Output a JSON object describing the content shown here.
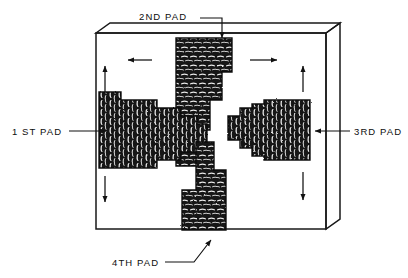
{
  "figure": {
    "title": "",
    "background_color": "#ffffff",
    "ink_color": "#111111",
    "plate": {
      "name": "rectangular-plate",
      "face": {
        "x": 96,
        "y": 33,
        "width": 230,
        "height": 196
      },
      "depth_offset": {
        "dx": 14,
        "dy": -10
      },
      "stroke_width": 1.6
    },
    "labels": [
      {
        "id": "pad1",
        "text": "1 ST  PAD",
        "x": 12,
        "y": 134,
        "anchor": "start"
      },
      {
        "id": "pad2",
        "text": "2ND PAD",
        "x": 140,
        "y": 16,
        "anchor": "start"
      },
      {
        "id": "pad3",
        "text": "3RD PAD",
        "x": 352,
        "y": 134,
        "anchor": "start"
      },
      {
        "id": "pad4",
        "text": "4TH PAD",
        "x": 112,
        "y": 268,
        "anchor": "start"
      }
    ],
    "leaders": [
      {
        "id": "leader-pad1",
        "from": [
          69,
          131
        ],
        "to": [
          108,
          131
        ],
        "arrow": "end"
      },
      {
        "id": "leader-pad2",
        "from": [
          200,
          18
        ],
        "bend": [
          222,
          18
        ],
        "to": [
          222,
          40
        ],
        "arrow": "end"
      },
      {
        "id": "leader-pad3",
        "from": [
          348,
          131
        ],
        "to": [
          313,
          131
        ],
        "arrow": "end"
      },
      {
        "id": "leader-pad4",
        "from": [
          166,
          263
        ],
        "bend": [
          196,
          263
        ],
        "to": [
          212,
          239
        ],
        "arrow": "end"
      }
    ],
    "direction_arrows": [
      {
        "id": "arrow-top-left",
        "direction": "left",
        "x1": 152,
        "y1": 60,
        "x2": 128,
        "y2": 60
      },
      {
        "id": "arrow-top-right",
        "direction": "right",
        "x1": 250,
        "y1": 60,
        "x2": 277,
        "y2": 60
      },
      {
        "id": "arrow-left-up",
        "direction": "up",
        "x1": 105,
        "y1": 92,
        "x2": 105,
        "y2": 66
      },
      {
        "id": "arrow-left-down",
        "direction": "down",
        "x1": 105,
        "y1": 176,
        "x2": 105,
        "y2": 202
      },
      {
        "id": "arrow-right-up",
        "direction": "up",
        "x1": 303,
        "y1": 92,
        "x2": 303,
        "y2": 66
      },
      {
        "id": "arrow-right-down",
        "direction": "down",
        "x1": 303,
        "y1": 172,
        "x2": 303,
        "y2": 200
      }
    ],
    "pads": [
      {
        "id": "pad-2",
        "label": "2ND PAD",
        "orientation": "vertical",
        "bead_axis": "horizontal-beads-stacked-vertically",
        "steps": [
          {
            "x": 176,
            "y": 38,
            "w": 56,
            "h": 34
          },
          {
            "x": 176,
            "y": 38,
            "w": 46,
            "h": 62
          },
          {
            "x": 176,
            "y": 38,
            "w": 34,
            "h": 92
          },
          {
            "x": 176,
            "y": 38,
            "w": 24,
            "h": 128
          }
        ]
      },
      {
        "id": "pad-1",
        "label": "1 ST PAD",
        "orientation": "horizontal",
        "bead_axis": "vertical-beads-in-rows",
        "steps": [
          {
            "x": 99,
            "y": 92,
            "w": 22,
            "h": 76
          },
          {
            "x": 99,
            "y": 100,
            "w": 58,
            "h": 68
          },
          {
            "x": 99,
            "y": 108,
            "w": 82,
            "h": 52
          },
          {
            "x": 99,
            "y": 116,
            "w": 98,
            "h": 36
          },
          {
            "x": 99,
            "y": 124,
            "w": 108,
            "h": 22
          }
        ]
      },
      {
        "id": "pad-3",
        "label": "3RD PAD",
        "orientation": "horizontal",
        "bead_axis": "vertical-beads-in-rows",
        "steps": [
          {
            "x": 228,
            "y": 116,
            "w": 82,
            "h": 24
          },
          {
            "x": 240,
            "y": 108,
            "w": 70,
            "h": 40
          },
          {
            "x": 252,
            "y": 104,
            "w": 58,
            "h": 52
          },
          {
            "x": 264,
            "y": 100,
            "w": 46,
            "h": 60
          }
        ]
      },
      {
        "id": "pad-4",
        "label": "4TH PAD",
        "orientation": "vertical",
        "bead_axis": "horizontal-beads-stacked-vertically",
        "steps": [
          {
            "x": 196,
            "y": 142,
            "w": 18,
            "h": 88
          },
          {
            "x": 196,
            "y": 170,
            "w": 30,
            "h": 60
          },
          {
            "x": 182,
            "y": 190,
            "w": 44,
            "h": 40
          }
        ]
      }
    ]
  }
}
